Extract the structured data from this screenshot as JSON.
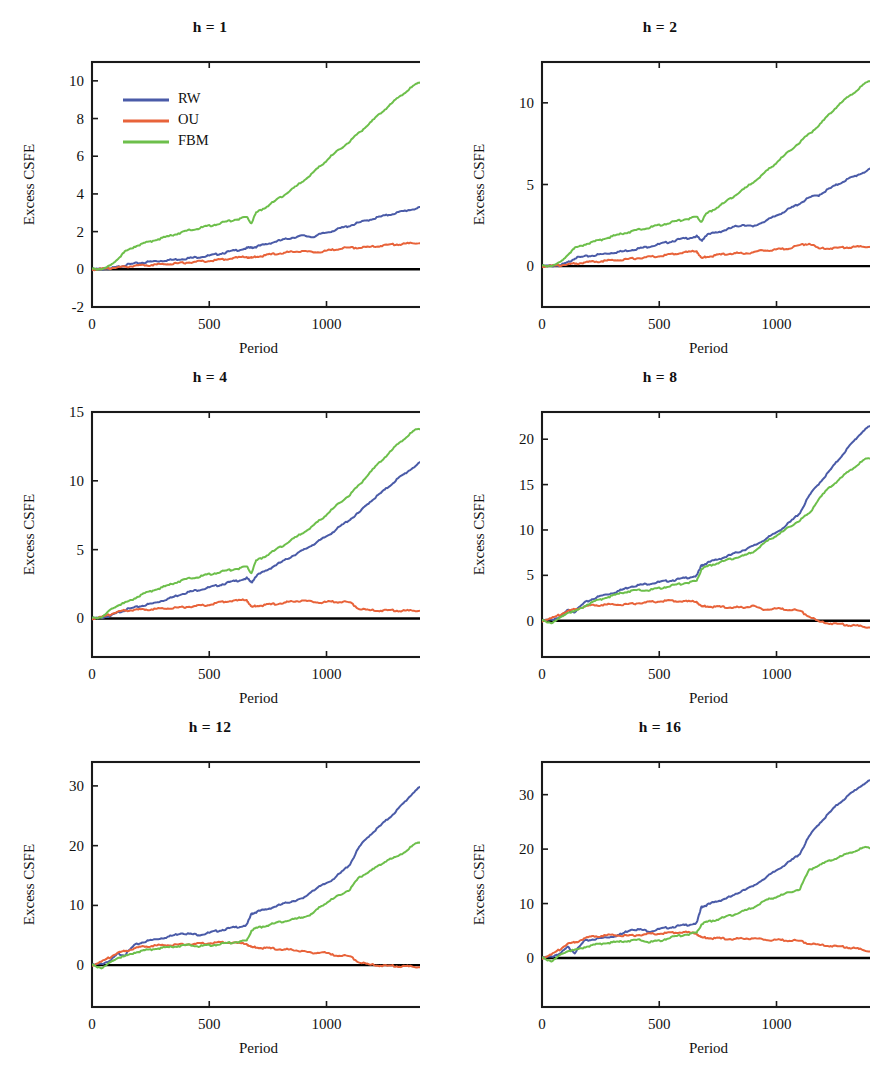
{
  "figure": {
    "width": 888,
    "height": 1070,
    "background": "#ffffff",
    "series_colors": {
      "RW": "#4a5ba8",
      "OU": "#e8633a",
      "FBM": "#6dbf4b"
    },
    "axis_color": "#1a1a1a",
    "zero_line_color": "#000000"
  },
  "legend": {
    "position": "upper-left-of-panel-1",
    "entries": [
      {
        "label": "RW",
        "color": "#4a5ba8"
      },
      {
        "label": "OU",
        "color": "#e8633a"
      },
      {
        "label": "FBM",
        "color": "#6dbf4b"
      }
    ]
  },
  "chart_data": [
    {
      "type": "line",
      "title": "h = 1",
      "xlabel": "Period",
      "ylabel": "Excess CSFE",
      "xlim": [
        0,
        1420
      ],
      "ylim": [
        -2,
        11
      ],
      "xticks": [
        0,
        500,
        1000
      ],
      "yticks": [
        -2,
        0,
        2,
        4,
        6,
        8,
        10
      ],
      "grid": false,
      "legend": true,
      "x": [
        0,
        40,
        80,
        110,
        140,
        180,
        220,
        260,
        300,
        340,
        380,
        420,
        460,
        500,
        540,
        580,
        620,
        660,
        680,
        700,
        740,
        780,
        820,
        860,
        900,
        940,
        980,
        1020,
        1060,
        1100,
        1140,
        1180,
        1220,
        1260,
        1300,
        1340,
        1380,
        1420
      ],
      "series": [
        {
          "name": "RW",
          "values": [
            0,
            0.02,
            0.05,
            0.12,
            0.22,
            0.3,
            0.36,
            0.42,
            0.46,
            0.5,
            0.55,
            0.6,
            0.66,
            0.72,
            0.82,
            0.92,
            1.02,
            1.12,
            1.15,
            1.2,
            1.32,
            1.46,
            1.58,
            1.7,
            1.78,
            1.72,
            1.88,
            2.02,
            2.18,
            2.32,
            2.48,
            2.62,
            2.76,
            2.88,
            3.0,
            3.12,
            3.22,
            3.3
          ]
        },
        {
          "name": "OU",
          "values": [
            0,
            0.02,
            0.06,
            0.1,
            0.14,
            0.18,
            0.21,
            0.24,
            0.27,
            0.3,
            0.33,
            0.37,
            0.41,
            0.45,
            0.5,
            0.55,
            0.62,
            0.66,
            0.6,
            0.66,
            0.74,
            0.82,
            0.88,
            0.94,
            0.98,
            0.9,
            0.95,
            1.02,
            1.1,
            1.16,
            1.14,
            1.18,
            1.24,
            1.3,
            1.33,
            1.36,
            1.4,
            1.42
          ]
        },
        {
          "name": "FBM",
          "values": [
            0,
            0.04,
            0.18,
            0.55,
            0.92,
            1.2,
            1.38,
            1.52,
            1.66,
            1.8,
            1.95,
            2.08,
            2.2,
            2.3,
            2.42,
            2.55,
            2.66,
            2.76,
            2.45,
            3.0,
            3.3,
            3.62,
            3.95,
            4.3,
            4.7,
            5.1,
            5.55,
            6.0,
            6.4,
            6.8,
            7.25,
            7.7,
            8.15,
            8.6,
            9.05,
            9.45,
            9.8,
            10.1
          ]
        }
      ]
    },
    {
      "type": "line",
      "title": "h = 2",
      "xlabel": "Period",
      "ylabel": "Excess CSFE",
      "xlim": [
        0,
        1420
      ],
      "ylim": [
        -2.5,
        12.5
      ],
      "xticks": [
        0,
        500,
        1000
      ],
      "yticks": [
        0,
        5,
        10
      ],
      "grid": false,
      "legend": false,
      "x": [
        0,
        40,
        80,
        110,
        140,
        180,
        220,
        260,
        300,
        340,
        380,
        420,
        460,
        500,
        540,
        580,
        620,
        660,
        680,
        700,
        740,
        780,
        820,
        860,
        900,
        940,
        980,
        1020,
        1060,
        1100,
        1140,
        1180,
        1220,
        1260,
        1300,
        1340,
        1380,
        1420
      ],
      "series": [
        {
          "name": "RW",
          "values": [
            0,
            0.02,
            0.06,
            0.22,
            0.5,
            0.58,
            0.66,
            0.74,
            0.82,
            0.9,
            1.0,
            1.1,
            1.22,
            1.34,
            1.48,
            1.62,
            1.72,
            1.82,
            1.55,
            1.9,
            2.05,
            2.2,
            2.4,
            2.55,
            2.4,
            2.7,
            2.95,
            3.25,
            3.55,
            3.85,
            4.2,
            4.35,
            4.7,
            5.0,
            5.3,
            5.55,
            5.8,
            6.05
          ]
        },
        {
          "name": "OU",
          "values": [
            0,
            0.02,
            0.05,
            0.1,
            0.16,
            0.22,
            0.27,
            0.32,
            0.36,
            0.4,
            0.45,
            0.5,
            0.56,
            0.62,
            0.7,
            0.78,
            0.86,
            0.92,
            0.48,
            0.56,
            0.66,
            0.74,
            0.8,
            0.78,
            0.86,
            0.96,
            1.0,
            1.05,
            1.1,
            1.3,
            1.38,
            1.08,
            1.1,
            1.12,
            1.16,
            1.18,
            1.2,
            1.22
          ]
        },
        {
          "name": "FBM",
          "values": [
            0,
            0.05,
            0.22,
            0.7,
            1.1,
            1.32,
            1.5,
            1.66,
            1.82,
            1.98,
            2.12,
            2.25,
            2.38,
            2.5,
            2.64,
            2.78,
            2.9,
            3.0,
            2.72,
            3.2,
            3.55,
            3.9,
            4.3,
            4.7,
            5.15,
            5.6,
            6.1,
            6.6,
            7.1,
            7.6,
            8.1,
            8.6,
            9.2,
            9.8,
            10.3,
            10.75,
            11.2,
            11.55
          ]
        }
      ]
    },
    {
      "type": "line",
      "title": "h = 4",
      "xlabel": "Period",
      "ylabel": "Excess CSFE",
      "xlim": [
        0,
        1420
      ],
      "ylim": [
        -2.8,
        15
      ],
      "xticks": [
        0,
        500,
        1000
      ],
      "yticks": [
        0,
        5,
        10,
        15
      ],
      "grid": false,
      "legend": false,
      "x": [
        0,
        40,
        80,
        110,
        140,
        180,
        220,
        260,
        300,
        340,
        380,
        420,
        460,
        500,
        540,
        580,
        620,
        660,
        680,
        700,
        740,
        780,
        820,
        860,
        900,
        940,
        980,
        1020,
        1060,
        1100,
        1140,
        1180,
        1220,
        1260,
        1300,
        1340,
        1380,
        1420
      ],
      "series": [
        {
          "name": "RW",
          "values": [
            0,
            0.05,
            0.2,
            0.42,
            0.62,
            0.78,
            0.95,
            1.1,
            1.3,
            1.52,
            1.78,
            1.95,
            2.1,
            2.25,
            2.42,
            2.6,
            2.75,
            2.92,
            2.6,
            3.1,
            3.45,
            3.85,
            4.2,
            4.6,
            4.95,
            5.35,
            5.75,
            6.2,
            6.7,
            7.2,
            7.7,
            8.4,
            8.95,
            9.5,
            10.1,
            10.6,
            11.1,
            11.5
          ]
        },
        {
          "name": "OU",
          "values": [
            0,
            0.1,
            0.3,
            0.48,
            0.58,
            0.62,
            0.64,
            0.68,
            0.72,
            0.76,
            0.8,
            0.86,
            0.92,
            1.0,
            1.15,
            1.25,
            1.3,
            1.35,
            0.82,
            0.9,
            0.98,
            1.05,
            1.15,
            1.25,
            1.32,
            1.2,
            1.18,
            1.22,
            1.2,
            1.18,
            0.68,
            0.6,
            0.58,
            0.6,
            0.58,
            0.56,
            0.58,
            0.6
          ]
        },
        {
          "name": "FBM",
          "values": [
            0,
            0.12,
            0.6,
            0.95,
            1.12,
            1.45,
            1.8,
            2.05,
            2.25,
            2.5,
            2.75,
            2.92,
            3.05,
            3.2,
            3.35,
            3.5,
            3.62,
            3.75,
            3.3,
            4.2,
            4.55,
            4.95,
            5.35,
            5.8,
            6.25,
            6.7,
            7.25,
            7.85,
            8.45,
            9.0,
            9.7,
            10.5,
            11.2,
            11.9,
            12.6,
            13.2,
            13.7,
            13.9
          ]
        }
      ]
    },
    {
      "type": "line",
      "title": "h = 8",
      "xlabel": "Period",
      "ylabel": "Excess CSFE",
      "xlim": [
        0,
        1420
      ],
      "ylim": [
        -4,
        23
      ],
      "xticks": [
        0,
        500,
        1000
      ],
      "yticks": [
        0,
        5,
        10,
        15,
        20
      ],
      "grid": false,
      "legend": false,
      "x": [
        0,
        40,
        80,
        110,
        140,
        180,
        220,
        260,
        300,
        340,
        380,
        420,
        460,
        500,
        540,
        580,
        620,
        660,
        680,
        700,
        740,
        780,
        820,
        860,
        900,
        940,
        980,
        1020,
        1060,
        1100,
        1140,
        1180,
        1220,
        1260,
        1300,
        1340,
        1380,
        1420
      ],
      "series": [
        {
          "name": "RW",
          "values": [
            0,
            0.1,
            0.45,
            1.15,
            1.0,
            1.95,
            2.45,
            2.8,
            3.05,
            3.4,
            3.8,
            3.95,
            4.1,
            4.25,
            4.4,
            4.55,
            4.75,
            4.95,
            6.1,
            6.3,
            6.7,
            7.0,
            7.4,
            7.8,
            8.2,
            8.8,
            9.4,
            10.1,
            10.9,
            11.9,
            13.8,
            15.1,
            16.3,
            17.6,
            18.9,
            20.1,
            21.2,
            21.5
          ]
        },
        {
          "name": "OU",
          "values": [
            0,
            0.25,
            0.7,
            1.05,
            1.25,
            1.55,
            1.7,
            1.75,
            1.8,
            1.78,
            1.85,
            1.95,
            2.05,
            2.15,
            2.2,
            2.15,
            2.12,
            2.1,
            1.55,
            1.58,
            1.52,
            1.5,
            1.48,
            1.45,
            1.7,
            1.2,
            1.35,
            1.3,
            1.2,
            1.1,
            0.45,
            -0.1,
            -0.25,
            -0.35,
            -0.45,
            -0.55,
            -0.68,
            -0.75
          ]
        },
        {
          "name": "FBM",
          "values": [
            0,
            -0.2,
            0.3,
            0.9,
            1.0,
            1.6,
            2.1,
            2.45,
            2.75,
            3.05,
            3.3,
            3.35,
            3.4,
            3.55,
            3.8,
            4.0,
            4.2,
            4.35,
            5.7,
            5.95,
            6.3,
            6.6,
            6.9,
            7.15,
            7.6,
            8.4,
            9.1,
            9.7,
            10.4,
            11.1,
            11.8,
            13.4,
            14.5,
            15.4,
            16.3,
            17.1,
            17.8,
            18.1
          ]
        }
      ]
    },
    {
      "type": "line",
      "title": "h = 12",
      "xlabel": "Period",
      "ylabel": "Excess CSFE",
      "xlim": [
        0,
        1420
      ],
      "ylim": [
        -7,
        34
      ],
      "xticks": [
        0,
        500,
        1000
      ],
      "yticks": [
        0,
        10,
        20,
        30
      ],
      "grid": false,
      "legend": false,
      "x": [
        0,
        40,
        80,
        110,
        140,
        180,
        220,
        260,
        300,
        340,
        380,
        420,
        460,
        500,
        540,
        580,
        620,
        660,
        680,
        700,
        740,
        780,
        820,
        860,
        900,
        940,
        980,
        1020,
        1060,
        1100,
        1140,
        1180,
        1220,
        1260,
        1300,
        1340,
        1380,
        1420
      ],
      "series": [
        {
          "name": "RW",
          "values": [
            0,
            0.2,
            0.8,
            1.9,
            1.7,
            3.3,
            3.9,
            4.25,
            4.55,
            4.9,
            5.4,
            5.2,
            5.1,
            5.4,
            5.8,
            6.1,
            6.4,
            6.7,
            8.6,
            8.9,
            9.3,
            9.8,
            10.3,
            10.8,
            11.1,
            12.5,
            13.3,
            14.2,
            15.4,
            16.9,
            19.8,
            21.6,
            23.0,
            24.4,
            25.9,
            27.6,
            29.3,
            30.1
          ]
        },
        {
          "name": "OU",
          "values": [
            0,
            0.55,
            1.4,
            2.05,
            2.35,
            2.8,
            3.1,
            3.25,
            3.35,
            3.4,
            3.45,
            3.5,
            3.58,
            3.7,
            3.78,
            3.8,
            3.7,
            3.55,
            3.0,
            2.95,
            2.85,
            2.75,
            2.65,
            2.55,
            2.4,
            1.95,
            2.3,
            1.75,
            1.6,
            1.5,
            0.45,
            0.1,
            0.0,
            -0.1,
            -0.15,
            -0.2,
            -0.25,
            -0.3
          ]
        },
        {
          "name": "FBM",
          "values": [
            0,
            -0.4,
            0.4,
            1.25,
            1.45,
            2.1,
            2.45,
            2.7,
            2.9,
            3.05,
            3.25,
            3.35,
            3.2,
            3.3,
            3.5,
            3.7,
            3.9,
            4.05,
            5.8,
            6.2,
            6.6,
            7.0,
            7.35,
            7.65,
            8.1,
            8.6,
            10.0,
            10.9,
            11.8,
            12.7,
            14.7,
            15.6,
            16.5,
            17.6,
            18.1,
            19.2,
            20.3,
            21.0
          ]
        }
      ]
    },
    {
      "type": "line",
      "title": "h = 16",
      "xlabel": "Period",
      "ylabel": "Excess CSFE",
      "xlim": [
        0,
        1420
      ],
      "ylim": [
        -9,
        36
      ],
      "xticks": [
        0,
        500,
        1000
      ],
      "yticks": [
        0,
        10,
        20,
        30
      ],
      "grid": false,
      "legend": false,
      "x": [
        0,
        40,
        80,
        110,
        140,
        180,
        220,
        260,
        300,
        340,
        380,
        420,
        460,
        500,
        540,
        580,
        620,
        660,
        680,
        700,
        740,
        780,
        820,
        860,
        900,
        940,
        980,
        1020,
        1060,
        1100,
        1140,
        1180,
        1220,
        1260,
        1300,
        1340,
        1380,
        1420
      ],
      "series": [
        {
          "name": "RW",
          "values": [
            0,
            0.25,
            0.9,
            2.0,
            1.0,
            3.1,
            3.45,
            3.7,
            3.95,
            4.4,
            5.3,
            5.2,
            4.9,
            5.3,
            5.6,
            5.85,
            6.1,
            6.4,
            9.4,
            9.7,
            10.3,
            10.9,
            11.5,
            12.6,
            13.1,
            14.4,
            15.5,
            16.7,
            17.8,
            19.2,
            22.4,
            24.6,
            26.4,
            28.2,
            29.6,
            31.0,
            32.2,
            32.8
          ]
        },
        {
          "name": "OU",
          "values": [
            0,
            0.6,
            1.7,
            2.6,
            2.85,
            3.6,
            3.95,
            4.1,
            4.25,
            4.15,
            4.1,
            4.25,
            4.4,
            4.5,
            4.6,
            4.7,
            4.7,
            4.45,
            3.75,
            3.7,
            3.6,
            3.55,
            3.5,
            3.6,
            3.65,
            3.4,
            3.35,
            3.3,
            3.2,
            3.15,
            2.6,
            2.4,
            2.3,
            2.15,
            2.0,
            1.75,
            1.4,
            1.1
          ]
        },
        {
          "name": "FBM",
          "values": [
            0,
            -0.5,
            0.5,
            1.3,
            1.4,
            2.0,
            2.4,
            2.7,
            2.85,
            3.0,
            3.2,
            3.3,
            2.95,
            3.1,
            3.7,
            4.05,
            4.35,
            4.6,
            6.2,
            6.6,
            7.0,
            7.5,
            8.0,
            8.6,
            9.3,
            10.3,
            11.0,
            11.5,
            12.1,
            12.7,
            16.2,
            17.0,
            17.7,
            18.4,
            19.1,
            19.8,
            20.3,
            20.2
          ]
        }
      ]
    }
  ]
}
